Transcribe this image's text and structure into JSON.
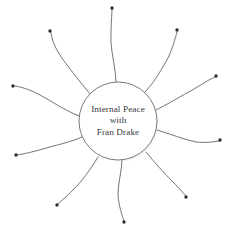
{
  "diagram": {
    "kind": "sunburst-mindmap",
    "hub": {
      "shape": "circle",
      "lines": [
        "Internal Peace",
        "with",
        "Fran Drake"
      ],
      "center_x": 118,
      "center_y": 121,
      "radius": 39,
      "fill_color": "#ffffff",
      "stroke_color": "#6a6a70",
      "shadow_color": "#b9b9be"
    },
    "style": {
      "background_color": "#ffffff",
      "ray_stroke_color": "#5a5a5f",
      "ray_tip_color": "#2b2b30",
      "text_color": "#3a3a40"
    },
    "rays": [
      {
        "name": "ray-north",
        "path": "M 116 82 C 115 62 110 50 111 34 C 111 22 112 15 112 9",
        "tip_x": 112,
        "tip_y": 8,
        "tip_r": 1.7
      },
      {
        "name": "ray-northeast",
        "path": "M 143 94 C 154 83 160 72 168 58 C 173 47 175 39 177 32",
        "tip_x": 177,
        "tip_y": 30,
        "tip_r": 1.7
      },
      {
        "name": "ray-east-upper",
        "path": "M 156 110 C 170 103 181 96 194 89 C 204 83 210 79 215 77",
        "tip_x": 216,
        "tip_y": 76,
        "tip_r": 1.7
      },
      {
        "name": "ray-east-lower",
        "path": "M 157 130 C 171 134 182 139 196 142 C 206 143 213 142 219 141",
        "tip_x": 220,
        "tip_y": 140,
        "tip_r": 1.7
      },
      {
        "name": "ray-southeast",
        "path": "M 146 152 C 155 163 163 172 173 182 C 180 189 184 194 186 196",
        "tip_x": 186,
        "tip_y": 197,
        "tip_r": 1.7
      },
      {
        "name": "ray-south",
        "path": "M 122 160 C 121 178 116 189 119 203 C 121 213 123 218 124 221",
        "tip_x": 124,
        "tip_y": 222,
        "tip_r": 1.7
      },
      {
        "name": "ray-southwest",
        "path": "M 98 157 C 90 170 83 180 73 190 C 66 197 61 201 58 204",
        "tip_x": 57,
        "tip_y": 205,
        "tip_r": 1.7
      },
      {
        "name": "ray-west-lower",
        "path": "M 82 137 C 68 143 56 145 43 149 C 32 152 24 154 17 155",
        "tip_x": 16,
        "tip_y": 155,
        "tip_r": 1.7
      },
      {
        "name": "ray-west-upper",
        "path": "M 79 116 C 64 110 53 102 40 95 C 29 89 21 87 15 86",
        "tip_x": 13,
        "tip_y": 86,
        "tip_r": 1.7
      },
      {
        "name": "ray-northwest",
        "path": "M 90 94 C 81 83 73 73 64 61 C 56 50 52 41 51 33",
        "tip_x": 50,
        "tip_y": 31,
        "tip_r": 1.7
      }
    ]
  }
}
